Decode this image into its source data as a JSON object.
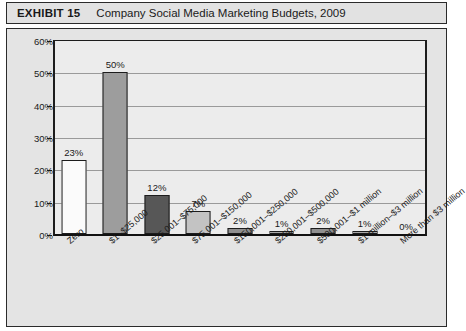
{
  "header": {
    "exhibit_label": "EXHIBIT 15",
    "title": "Company Social Media Marketing Budgets, 2009"
  },
  "chart_data": {
    "type": "bar",
    "title": "Company Social Media Marketing Budgets, 2009",
    "xlabel": "",
    "ylabel": "",
    "ylim": [
      0,
      60
    ],
    "ytick_labels": [
      "0%",
      "10%",
      "20%",
      "30%",
      "40%",
      "50%",
      "60%"
    ],
    "ytick_values": [
      0,
      10,
      20,
      30,
      40,
      50,
      60
    ],
    "grid": "horizontal",
    "legend": "none",
    "categories": [
      "Zero",
      "$1–$25,000",
      "$25,001–$75,000",
      "$75,001–$150,000",
      "$150,001–$250,000",
      "$250,001–$500,000",
      "$500,001–$1 million",
      "$1 million–$3 million",
      "More than $3 million"
    ],
    "values": [
      23,
      50,
      12,
      7,
      2,
      1,
      2,
      1,
      0
    ],
    "data_labels": [
      "23%",
      "50%",
      "12%",
      "7%",
      "2%",
      "1%",
      "2%",
      "1%",
      "0%"
    ],
    "bar_colors": [
      "#fbfbfb",
      "#9d9d9d",
      "#575757",
      "#c3c3c3",
      "#8f8f8f",
      "#a8a8a8",
      "#8f8f8f",
      "#a8a8a8",
      "#ececec"
    ]
  },
  "colors": {
    "figure_background": "#e4e4e4",
    "header_background": "#e2e2e2",
    "plot_background": "#ececec",
    "axis": "#1c1c1c",
    "gridline": "#9a9a9a",
    "text": "#1a1a1a"
  }
}
